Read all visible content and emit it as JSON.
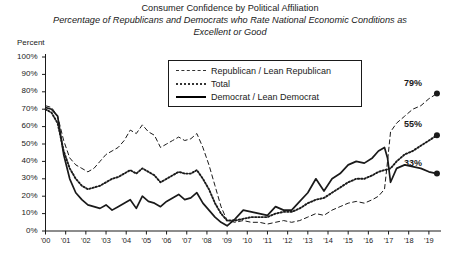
{
  "chart_data": {
    "type": "line",
    "title": "Consumer Confidence by Political Affiliation",
    "subtitle": "Percentage of Republicans and Democrats who Rate National Economic Conditions as Excellent or Good",
    "ylabel": "Percent",
    "xlabel": "",
    "ylim": [
      0,
      100
    ],
    "ytick_labels": [
      "100%",
      "90%",
      "80%",
      "70%",
      "60%",
      "50%",
      "40%",
      "30%",
      "20%",
      "10%",
      "0%"
    ],
    "ytick_values": [
      100,
      90,
      80,
      70,
      60,
      50,
      40,
      30,
      20,
      10,
      0
    ],
    "xtick_labels": [
      "'00",
      "'01",
      "'02",
      "'03",
      "'04",
      "'05",
      "'06",
      "'07",
      "'08",
      "'09",
      "'10",
      "'11",
      "'12",
      "'13",
      "'14",
      "'15",
      "'16",
      "'17",
      "'18",
      "'19"
    ],
    "xlim": [
      2000,
      2019.6
    ],
    "grid": false,
    "legend_position": "top-center",
    "line_color": "#1a1a1a",
    "series": [
      {
        "name": "Republican / Lean Republican",
        "style": "dashed",
        "end_label": "79%",
        "end_value": 79,
        "x": [
          2000.0,
          2000.3,
          2000.6,
          2000.9,
          2001.2,
          2001.5,
          2001.8,
          2002.1,
          2002.4,
          2002.7,
          2003.0,
          2003.3,
          2003.6,
          2003.9,
          2004.2,
          2004.5,
          2004.8,
          2005.1,
          2005.4,
          2005.7,
          2006.0,
          2006.3,
          2006.6,
          2006.9,
          2007.2,
          2007.5,
          2007.8,
          2008.1,
          2008.4,
          2008.7,
          2009.0,
          2009.4,
          2009.8,
          2010.2,
          2010.6,
          2011.0,
          2011.4,
          2011.8,
          2012.2,
          2012.6,
          2013.0,
          2013.4,
          2013.8,
          2014.2,
          2014.6,
          2015.0,
          2015.4,
          2015.8,
          2016.2,
          2016.5,
          2016.8,
          2016.95,
          2017.1,
          2017.4,
          2017.8,
          2018.2,
          2018.6,
          2019.0,
          2019.4
        ],
        "y": [
          72,
          71,
          66,
          52,
          42,
          38,
          36,
          34,
          36,
          40,
          44,
          46,
          48,
          52,
          58,
          56,
          61,
          57,
          55,
          48,
          50,
          52,
          54,
          52,
          53,
          56,
          48,
          38,
          26,
          14,
          6,
          5,
          6,
          5,
          5,
          4,
          5,
          6,
          5,
          6,
          8,
          10,
          9,
          12,
          14,
          16,
          17,
          16,
          18,
          20,
          24,
          40,
          57,
          62,
          66,
          70,
          72,
          76,
          79
        ]
      },
      {
        "name": "Total",
        "style": "dotted",
        "end_label": "55%",
        "end_value": 55,
        "x": [
          2000.0,
          2000.3,
          2000.6,
          2000.9,
          2001.2,
          2001.5,
          2001.8,
          2002.1,
          2002.4,
          2002.7,
          2003.0,
          2003.3,
          2003.6,
          2003.9,
          2004.2,
          2004.5,
          2004.8,
          2005.1,
          2005.4,
          2005.7,
          2006.0,
          2006.3,
          2006.6,
          2006.9,
          2007.2,
          2007.5,
          2007.8,
          2008.1,
          2008.4,
          2008.7,
          2009.0,
          2009.4,
          2009.8,
          2010.2,
          2010.6,
          2011.0,
          2011.4,
          2011.8,
          2012.2,
          2012.6,
          2013.0,
          2013.4,
          2013.8,
          2014.2,
          2014.6,
          2015.0,
          2015.4,
          2015.8,
          2016.2,
          2016.5,
          2016.8,
          2017.1,
          2017.4,
          2017.8,
          2018.2,
          2018.6,
          2019.0,
          2019.4
        ],
        "y": [
          70,
          68,
          62,
          46,
          36,
          30,
          26,
          24,
          25,
          26,
          28,
          30,
          31,
          33,
          35,
          33,
          36,
          34,
          32,
          28,
          30,
          32,
          34,
          33,
          33,
          35,
          30,
          24,
          16,
          10,
          6,
          6,
          7,
          8,
          8,
          8,
          10,
          11,
          11,
          13,
          16,
          18,
          19,
          22,
          25,
          28,
          30,
          30,
          32,
          34,
          35,
          36,
          40,
          44,
          46,
          49,
          52,
          55
        ]
      },
      {
        "name": "Democrat / Lean Democrat",
        "style": "solid",
        "end_label": "33%",
        "end_value": 33,
        "x": [
          2000.0,
          2000.3,
          2000.6,
          2000.9,
          2001.2,
          2001.5,
          2001.8,
          2002.1,
          2002.4,
          2002.7,
          2003.0,
          2003.3,
          2003.6,
          2003.9,
          2004.2,
          2004.5,
          2004.8,
          2005.1,
          2005.4,
          2005.7,
          2006.0,
          2006.3,
          2006.6,
          2006.9,
          2007.2,
          2007.5,
          2007.8,
          2008.1,
          2008.4,
          2008.7,
          2009.0,
          2009.4,
          2009.8,
          2010.2,
          2010.6,
          2011.0,
          2011.4,
          2011.8,
          2012.2,
          2012.6,
          2013.0,
          2013.4,
          2013.8,
          2014.2,
          2014.6,
          2015.0,
          2015.4,
          2015.8,
          2016.2,
          2016.5,
          2016.8,
          2016.95,
          2017.1,
          2017.4,
          2017.8,
          2018.2,
          2018.6,
          2019.0,
          2019.4
        ],
        "y": [
          71,
          70,
          66,
          44,
          30,
          22,
          18,
          15,
          14,
          13,
          15,
          12,
          14,
          16,
          18,
          13,
          20,
          17,
          16,
          14,
          17,
          19,
          21,
          18,
          19,
          22,
          16,
          12,
          8,
          5,
          3,
          7,
          12,
          11,
          10,
          9,
          14,
          12,
          12,
          17,
          22,
          30,
          23,
          30,
          33,
          38,
          40,
          39,
          42,
          46,
          48,
          42,
          28,
          36,
          38,
          37,
          36,
          34,
          33
        ]
      }
    ]
  }
}
